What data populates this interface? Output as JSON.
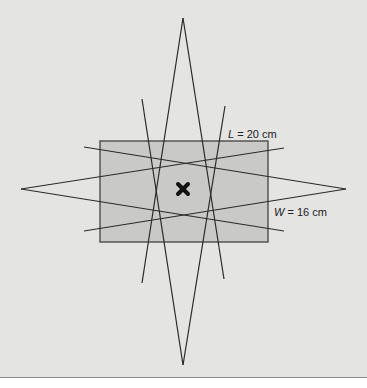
{
  "figure": {
    "length_label_var": "L",
    "length_label_rest": " = 20 cm",
    "width_label_var": "W",
    "width_label_rest": " = 16 cm",
    "center_marker": "x-mark",
    "colors": {
      "background": "#e4e4e2",
      "rectangle_fill": "#c9c9c7",
      "line": "#2a2a2a"
    }
  }
}
